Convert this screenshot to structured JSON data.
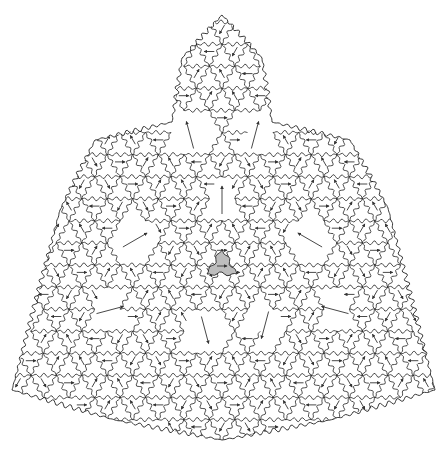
{
  "figure": {
    "title": "",
    "width": 447,
    "height": 461,
    "background": "#ffffff",
    "stroke_color": "#222222",
    "arrow_color": "#333333",
    "highlight_fill": "#bdbdbd",
    "highlight_center": [
      222,
      265
    ],
    "outline": [
      [
        222,
        15
      ],
      [
        262,
        58
      ],
      [
        272,
        122
      ],
      [
        350,
        140
      ],
      [
        388,
        208
      ],
      [
        435,
        390
      ],
      [
        330,
        420
      ],
      [
        222,
        440
      ],
      [
        115,
        420
      ],
      [
        12,
        390
      ],
      [
        60,
        210
      ],
      [
        95,
        140
      ],
      [
        172,
        122
      ],
      [
        182,
        58
      ]
    ],
    "lattice": {
      "origin": [
        222,
        265
      ],
      "spacing": 25.5,
      "wave_amplitude": 2.2,
      "wave_count": 3
    },
    "big_tiles": [
      {
        "center": [
          190,
          135
        ],
        "angle": -15
      },
      {
        "center": [
          255,
          135
        ],
        "angle": 15
      },
      {
        "center": [
          135,
          240
        ],
        "angle": 60
      },
      {
        "center": [
          310,
          240
        ],
        "angle": -60
      },
      {
        "center": [
          205,
          330
        ],
        "angle": 165
      },
      {
        "center": [
          265,
          325
        ],
        "angle": 195
      },
      {
        "center": [
          110,
          310
        ],
        "angle": 75
      },
      {
        "center": [
          335,
          310
        ],
        "angle": -75
      },
      {
        "center": [
          222,
          200
        ],
        "angle": 0
      }
    ]
  }
}
